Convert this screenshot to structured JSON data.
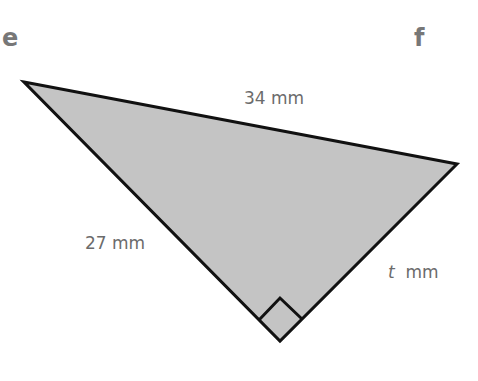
{
  "diagram": {
    "type": "right-triangle",
    "vertices": {
      "e_corner": {
        "x": 24,
        "y": 82
      },
      "f_corner": {
        "x": 457,
        "y": 164
      },
      "right_angle": {
        "x": 280,
        "y": 341
      }
    },
    "fill_color": "#c4c4c4",
    "stroke_color": "#111111",
    "corner_labels": {
      "e": "e",
      "f": "f"
    },
    "sides": {
      "hypotenuse": {
        "value": "34",
        "unit": "mm",
        "label": "34 mm"
      },
      "left_leg": {
        "value": "27",
        "unit": "mm",
        "label": "27 mm"
      },
      "right_leg": {
        "variable": "t",
        "unit": "mm"
      }
    },
    "right_angle_marker": true
  }
}
